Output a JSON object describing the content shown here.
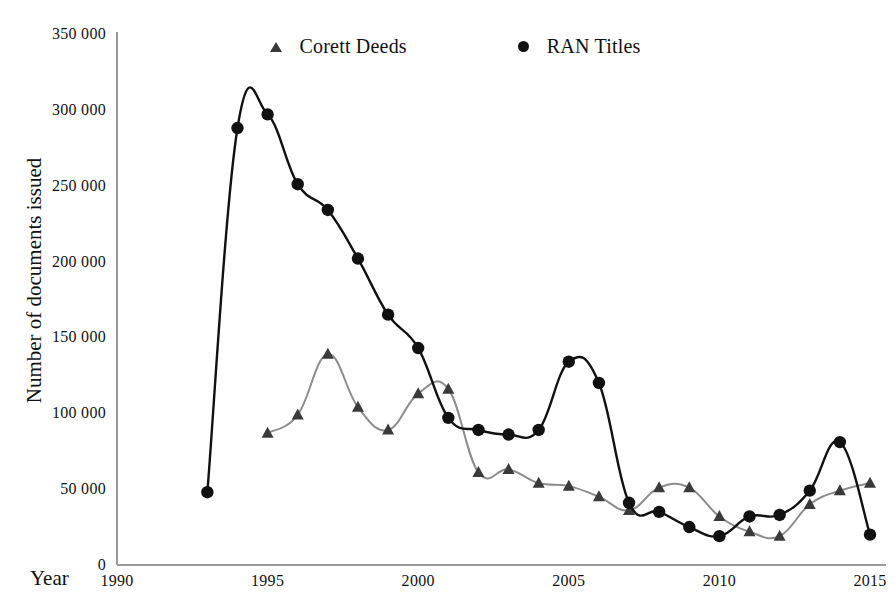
{
  "chart_data": {
    "type": "line",
    "title": "",
    "subtitle": "",
    "xlabel": "Year",
    "ylabel": "Number of documents issued",
    "xlim": [
      1990,
      2015
    ],
    "ylim": [
      0,
      350000
    ],
    "xticks": [
      "1990",
      "1995",
      "2000",
      "2005",
      "2010",
      "2015"
    ],
    "xtick_values": [
      1990,
      1995,
      2000,
      2005,
      2010,
      2015
    ],
    "yticks": [
      "0",
      "50 000",
      "100 000",
      "150 000",
      "200 000",
      "250 000",
      "300 000",
      "350 000"
    ],
    "ytick_values": [
      0,
      50000,
      100000,
      150000,
      200000,
      250000,
      300000,
      350000
    ],
    "grid": false,
    "legend_position": "top-center",
    "series": [
      {
        "name": "Corett Deeds",
        "color": "#8c8c8c",
        "marker": "triangle",
        "marker_color": "#3a3a3a",
        "x": [
          1995,
          1996,
          1997,
          1998,
          1999,
          2000,
          2001,
          2002,
          2003,
          2004,
          2005,
          2006,
          2007,
          2008,
          2009,
          2010,
          2011,
          2012,
          2013,
          2014,
          2015
        ],
        "values": [
          87000,
          99000,
          139000,
          104000,
          89000,
          113000,
          116000,
          61000,
          63000,
          54000,
          52000,
          45000,
          36000,
          51000,
          51000,
          32000,
          22000,
          19000,
          40000,
          49000,
          54000
        ]
      },
      {
        "name": "RAN Titles",
        "color": "#111111",
        "marker": "circle",
        "marker_color": "#111111",
        "x": [
          1993,
          1994,
          1995,
          1996,
          1997,
          1998,
          1999,
          2000,
          2001,
          2002,
          2003,
          2004,
          2005,
          2006,
          2007,
          2008,
          2009,
          2010,
          2011,
          2012,
          2013,
          2014,
          2015
        ],
        "values": [
          48000,
          288000,
          297000,
          251000,
          234000,
          202000,
          165000,
          143000,
          97000,
          89000,
          86000,
          89000,
          134000,
          120000,
          41000,
          35000,
          25000,
          19000,
          32000,
          33000,
          49000,
          81000,
          20000
        ]
      }
    ]
  },
  "legend": {
    "entries": [
      {
        "label": "Corett Deeds"
      },
      {
        "label": "RAN Titles"
      }
    ]
  },
  "axes": {
    "x_axis_title": "Year",
    "y_axis_title": "Number of documents issued"
  }
}
